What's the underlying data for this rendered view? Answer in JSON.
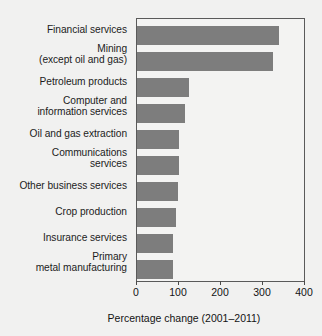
{
  "chart_data": {
    "type": "bar",
    "orientation": "horizontal",
    "title": "",
    "xlabel": "Percentage change (2001–2011)",
    "ylabel": "",
    "xlim": [
      0,
      400
    ],
    "xticks": [
      0,
      100,
      200,
      300,
      400
    ],
    "grid": false,
    "legend": null,
    "bar_color": "#7d7d7d",
    "categories": [
      "Financial services",
      "Mining\n(except oil and gas)",
      "Petroleum products",
      "Computer and\ninformation services",
      "Oil and gas extraction",
      "Communications\nservices",
      "Other business services",
      "Crop production",
      "Insurance services",
      "Primary\nmetal manufacturing"
    ],
    "values": [
      340,
      325,
      125,
      115,
      100,
      100,
      98,
      93,
      87,
      86
    ]
  },
  "categories_display": [
    {
      "line1": "Financial services",
      "line2": ""
    },
    {
      "line1": "Mining",
      "line2": "(except oil and gas)"
    },
    {
      "line1": "Petroleum products",
      "line2": ""
    },
    {
      "line1": "Computer and",
      "line2": "information services"
    },
    {
      "line1": "Oil and gas extraction",
      "line2": ""
    },
    {
      "line1": "Communications",
      "line2": "services"
    },
    {
      "line1": "Other business services",
      "line2": ""
    },
    {
      "line1": "Crop production",
      "line2": ""
    },
    {
      "line1": "Insurance services",
      "line2": ""
    },
    {
      "line1": "Primary",
      "line2": "metal manufacturing"
    }
  ],
  "axis": {
    "tick_labels": [
      "0",
      "100",
      "200",
      "300",
      "400"
    ],
    "title": "Percentage change (2001–2011)"
  }
}
